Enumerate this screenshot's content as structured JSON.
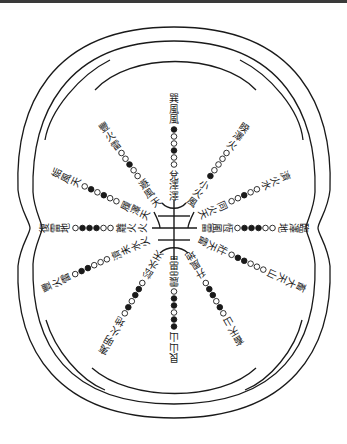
{
  "diagram": {
    "title": "",
    "center": {
      "x": 174,
      "y": 228
    },
    "colors": {
      "ink": "#1a1a1a",
      "paper": "#ffffff",
      "bar": "#3a3a3a"
    },
    "spokes": [
      {
        "id": "top",
        "angle": -90,
        "labels": [
          "澤",
          "澤",
          "兌"
        ],
        "circles": [
          "o",
          "o",
          "f",
          "o",
          "o",
          "f"
        ],
        "outer_text": [
          "風",
          "風",
          "巽"
        ]
      },
      {
        "id": "top-right",
        "angle": -55,
        "labels": [
          "風",
          "火",
          "小"
        ],
        "circles": [
          "f",
          "o",
          "o",
          "o",
          "o"
        ],
        "outer_text": [
          "火",
          "澤",
          "睽"
        ]
      },
      {
        "id": "right-upper",
        "angle": -25,
        "labels": [
          "天",
          "火",
          "同"
        ],
        "circles": [
          "o",
          "o",
          "f",
          "o",
          "o"
        ],
        "outer_text": [
          "水",
          "火",
          "濟"
        ]
      },
      {
        "id": "right",
        "angle": 0,
        "labels": [
          "雷",
          "風",
          "恆"
        ],
        "circles": [
          "o",
          "f",
          "f",
          "f",
          "o",
          "o"
        ],
        "outer_text": [
          "地",
          "澤",
          "臨"
        ]
      },
      {
        "id": "right-lower",
        "angle": 25,
        "labels": [
          "雷",
          "天",
          "壯"
        ],
        "circles": [
          "o",
          "f",
          "f",
          "o",
          "o",
          "o"
        ],
        "outer_text": [
          "山",
          "天",
          "大",
          "畜"
        ]
      },
      {
        "id": "bottom-right",
        "angle": 60,
        "labels": [
          "地",
          "風",
          "升"
        ],
        "circles": [
          "o",
          "f",
          "f",
          "o",
          "f",
          "o"
        ],
        "outer_text": [
          "山",
          "天",
          "畜"
        ]
      },
      {
        "id": "bottom",
        "angle": 90,
        "labels": [
          "雷",
          "雷",
          "震"
        ],
        "circles": [
          "o",
          "f",
          "f",
          "o",
          "f",
          "f"
        ],
        "outer_text": [
          "山",
          "山",
          "艮"
        ]
      },
      {
        "id": "bottom-left",
        "angle": 120,
        "labels": [
          "天",
          "水",
          "訟"
        ],
        "circles": [
          "o",
          "f",
          "f",
          "o",
          "f",
          "o"
        ],
        "outer_text": [
          "地",
          "火",
          "明",
          "夷"
        ]
      },
      {
        "id": "left-lower",
        "angle": 155,
        "labels": [
          "火",
          "水",
          "未",
          "濟"
        ],
        "circles": [
          "o",
          "o",
          "o",
          "f",
          "f",
          "o"
        ],
        "outer_text": [
          "雷",
          "火",
          "豐"
        ]
      },
      {
        "id": "left",
        "angle": 180,
        "labels": [
          "火",
          "火",
          "離"
        ],
        "circles": [
          "o",
          "o",
          "f",
          "f",
          "f",
          "o"
        ],
        "outer_text": [
          "地",
          "雷",
          "復"
        ]
      },
      {
        "id": "left-upper",
        "angle": 205,
        "labels": [
          "天",
          "澤",
          "履"
        ],
        "circles": [
          "o",
          "o",
          "f",
          "o",
          "f",
          "o"
        ],
        "outer_text": [
          "天",
          "風",
          "姤"
        ]
      },
      {
        "id": "top-left",
        "angle": 235,
        "labels": [
          "天",
          "風",
          "遯"
        ],
        "circles": [
          "o",
          "o",
          "f",
          "o",
          "o"
        ],
        "outer_text": [
          "雷",
          "火",
          "豐"
        ]
      }
    ]
  }
}
